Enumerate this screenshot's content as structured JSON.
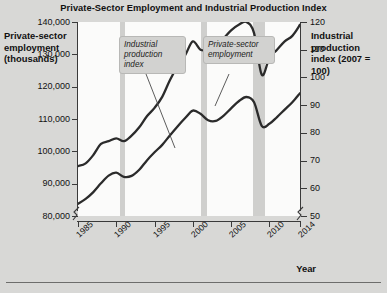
{
  "title": "Private-Sector Employment and Industrial Production Index",
  "axes": {
    "left_title": "Private-sector employment (thousands)",
    "right_title": "Industrial production index (2007 = 100)",
    "x_title": "Year"
  },
  "callouts": {
    "industrial_production_index": "Industrial production index",
    "private_sector_employment": "Private-sector employment"
  },
  "chart_data": {
    "type": "line",
    "title": "Private-Sector Employment and Industrial Production Index",
    "xlabel": "Year",
    "ylabel": "Private-sector employment (thousands)",
    "y2label": "Industrial production index (2007 = 100)",
    "grid": false,
    "legend_position": "inline-callouts",
    "xlim": [
      1985,
      2014
    ],
    "ylim": [
      80000,
      140000
    ],
    "y2lim": [
      50,
      120
    ],
    "y_axis_break": true,
    "y2_axis_break": true,
    "xticks": [
      1985,
      1990,
      1995,
      2000,
      2005,
      2010,
      2014
    ],
    "xtick_labels": [
      "1985",
      "1990",
      "1995",
      "2000",
      "2005",
      "2010",
      "2014"
    ],
    "yticks": [
      80000,
      90000,
      100000,
      110000,
      120000,
      130000,
      140000
    ],
    "ytick_labels": [
      "80,000",
      "90,000",
      "100,000",
      "110,000",
      "120,000",
      "130,000",
      "140,000"
    ],
    "y2ticks": [
      50,
      60,
      70,
      80,
      90,
      100,
      110,
      120
    ],
    "y2tick_labels": [
      "50",
      "60",
      "70",
      "80",
      "90",
      "100",
      "110",
      "120"
    ],
    "shaded_regions": [
      {
        "label": "recession",
        "start": 1990.5,
        "end": 1991.2
      },
      {
        "label": "recession",
        "start": 2001.1,
        "end": 2001.9
      },
      {
        "label": "recession",
        "start": 2007.9,
        "end": 2009.5
      }
    ],
    "x": [
      1985,
      1986,
      1987,
      1988,
      1989,
      1990,
      1991,
      1992,
      1993,
      1994,
      1995,
      1996,
      1997,
      1998,
      1999,
      2000,
      2001,
      2002,
      2003,
      2004,
      2005,
      2006,
      2007,
      2008,
      2009,
      2010,
      2011,
      2012,
      2013,
      2014
    ],
    "series": [
      {
        "name": "Private-sector employment",
        "axis": "left",
        "units": "thousands",
        "values": [
          83800,
          85300,
          87400,
          90100,
          92500,
          93400,
          92100,
          92400,
          94300,
          97200,
          99700,
          102000,
          104900,
          107700,
          110300,
          112600,
          111600,
          109600,
          109400,
          111000,
          113300,
          115500,
          116800,
          115200,
          107900,
          108500,
          110600,
          112900,
          115200,
          118000
        ]
      },
      {
        "name": "Industrial production index",
        "axis": "right",
        "units": "index (2007 = 100)",
        "values": [
          68,
          69,
          72,
          76,
          77,
          78,
          77,
          79,
          82,
          86,
          89,
          93,
          99,
          104,
          108,
          113,
          110,
          110,
          111,
          114,
          117,
          119,
          120,
          116,
          101,
          107,
          110,
          113,
          115,
          119
        ]
      }
    ]
  }
}
